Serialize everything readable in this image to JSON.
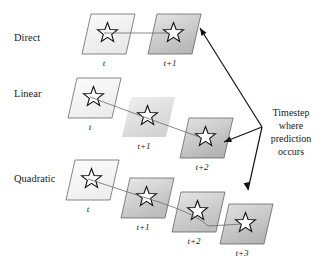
{
  "figure": {
    "background": "#ffffff",
    "width": 329,
    "height": 261
  },
  "rows": [
    {
      "name": "direct",
      "label": "Direct",
      "label_x": 14,
      "label_y": 41,
      "cards": [
        {
          "step": "t",
          "x": 82,
          "y": 14,
          "fill_from": "#fbfbfb",
          "fill_to": "#e9e9e9",
          "bordered": true,
          "label_x": 104,
          "label_y": 66
        },
        {
          "step": "t+1",
          "x": 148,
          "y": 14,
          "fill_from": "#e7e7e7",
          "fill_to": "#b8b8b8",
          "bordered": true,
          "label_x": 170,
          "label_y": 66
        }
      ]
    },
    {
      "name": "linear",
      "label": "Linear",
      "label_x": 14,
      "label_y": 97,
      "cards": [
        {
          "step": "t",
          "x": 68,
          "y": 78,
          "fill_from": "#fdfdfd",
          "fill_to": "#ececec",
          "bordered": true,
          "label_x": 90,
          "label_y": 130
        },
        {
          "step": "t+1",
          "x": 122,
          "y": 97,
          "fill_from": "#efefef",
          "fill_to": "#cfcfcf",
          "bordered": false,
          "label_x": 144,
          "label_y": 149
        },
        {
          "step": "t+2",
          "x": 180,
          "y": 118,
          "fill_from": "#e4e4e4",
          "fill_to": "#b4b4b4",
          "bordered": true,
          "label_x": 202,
          "label_y": 170
        }
      ]
    },
    {
      "name": "quadratic",
      "label": "Quadratic",
      "label_x": 14,
      "label_y": 182,
      "cards": [
        {
          "step": "t",
          "x": 66,
          "y": 160,
          "fill_from": "#fdfdfd",
          "fill_to": "#eeeeee",
          "bordered": true,
          "label_x": 88,
          "label_y": 212
        },
        {
          "step": "t+1",
          "x": 121,
          "y": 178,
          "fill_from": "#e9e9e9",
          "fill_to": "#bcbcbc",
          "bordered": true,
          "label_x": 143,
          "label_y": 230
        },
        {
          "step": "t+2",
          "x": 172,
          "y": 192,
          "fill_from": "#e6e6e6",
          "fill_to": "#bdbdbd",
          "bordered": true,
          "label_x": 194,
          "label_y": 244
        },
        {
          "step": "t+3",
          "x": 220,
          "y": 204,
          "fill_from": "#e2e2e2",
          "fill_to": "#b5b5b5",
          "bordered": true,
          "label_x": 242,
          "label_y": 256
        }
      ]
    }
  ],
  "callout": {
    "lines": [
      "Timestep",
      "where",
      "prediction",
      "occurs"
    ],
    "x": 291,
    "y_start": 116,
    "line_height": 13
  },
  "connectors": [
    {
      "name": "direct-path",
      "d": "M 104 33 L 170 33"
    },
    {
      "name": "linear-path",
      "d": "M 90 97 L 144 117 L 202 138"
    },
    {
      "name": "quadratic-path",
      "d": "M 88 179 L 143 197 Q 196 213 208 226 L 242 224"
    }
  ],
  "pointers": [
    {
      "name": "pointer-to-direct",
      "d": "M 262 127 L 200 28",
      "tip_x": 200,
      "tip_y": 28,
      "angle": 238
    },
    {
      "name": "pointer-to-linear",
      "d": "M 262 127 L 224 142",
      "tip_x": 224,
      "tip_y": 142,
      "angle": 158
    },
    {
      "name": "pointer-to-quadratic",
      "d": "M 262 127 L 248 190",
      "tip_x": 248,
      "tip_y": 190,
      "angle": 78
    }
  ],
  "colors": {
    "ink": "#1a1a1a",
    "card_border": "#555555",
    "connector": "#6a6a6a",
    "pointer": "#141414"
  }
}
